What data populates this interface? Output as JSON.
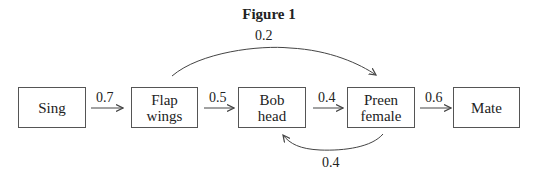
{
  "figure": {
    "title": "Figure 1"
  },
  "nodes": [
    {
      "id": "sing",
      "label": "Sing"
    },
    {
      "id": "flap",
      "label": "Flap wings"
    },
    {
      "id": "bob",
      "label": "Bob head"
    },
    {
      "id": "preen",
      "label": "Preen female"
    },
    {
      "id": "mate",
      "label": "Mate"
    }
  ],
  "edges": [
    {
      "from": "Sing",
      "to": "Flap wings",
      "weight": "0.7"
    },
    {
      "from": "Flap wings",
      "to": "Bob head",
      "weight": "0.5"
    },
    {
      "from": "Bob head",
      "to": "Preen female",
      "weight": "0.4"
    },
    {
      "from": "Preen female",
      "to": "Mate",
      "weight": "0.6"
    },
    {
      "from": "Flap wings",
      "to": "Preen female",
      "weight": "0.2"
    },
    {
      "from": "Preen female",
      "to": "Bob head",
      "weight": "0.4"
    }
  ]
}
